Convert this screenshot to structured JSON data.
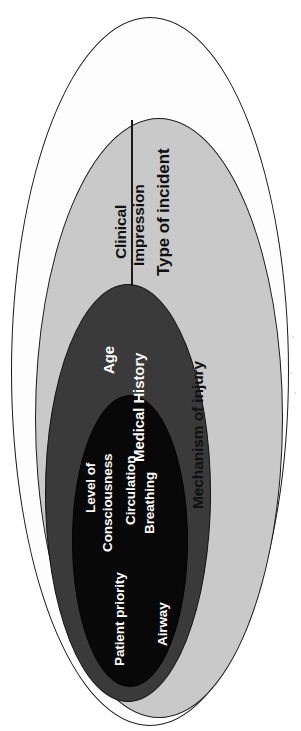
{
  "diagram": {
    "orientation": "rotated-90-ccw",
    "zones": [
      {
        "key": "type_of_incident",
        "fill": "#fdfdfd",
        "fill_name": "white",
        "level": 1,
        "labels": [
          "Type of incident"
        ]
      },
      {
        "key": "scene_assessment",
        "fill": "#c9c9c9",
        "fill_name": "light-gray",
        "level": 2,
        "labels": [
          "Clinical",
          "Impression",
          "Mechanism of injury"
        ]
      },
      {
        "key": "patient_background",
        "fill": "#3a3a3a",
        "fill_name": "dark-gray",
        "level": 3,
        "labels": [
          "Age",
          "Medical History"
        ]
      },
      {
        "key": "primary_survey",
        "fill": "#080808",
        "fill_name": "black",
        "level": 4,
        "labels": [
          "Level of",
          "Consciousness",
          "Circulation",
          "Breathing",
          "Patient priority",
          "Airway"
        ]
      }
    ],
    "labels": {
      "type_of_incident": "Type of incident",
      "clinical_line1": "Clinical",
      "clinical_line2": "Impression",
      "mechanism_of_injury": "Mechanism of injury",
      "age": "Age",
      "medical_history": "Medical History",
      "level_of_line1": "Level of",
      "level_of_line2": "Consciousness",
      "circulation": "Circulation",
      "breathing": "Breathing",
      "patient_priority": "Patient priority",
      "airway": "Airway"
    }
  },
  "colors": {
    "outer_fill": "#fdfdfd",
    "light_ring": "#c9c9c9",
    "dark_ring": "#3a3a3a",
    "core": "#080808",
    "outline": "#1a1a1a",
    "dark_text": "#101010",
    "light_text": "#ffffff"
  }
}
